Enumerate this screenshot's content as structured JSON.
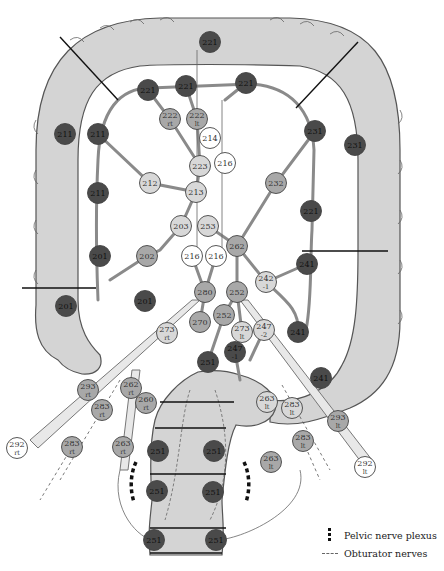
{
  "diagram": {
    "colors": {
      "colon_fill": "#d4d4d4",
      "colon_stroke": "#555555",
      "vessel": "#8a8a8a",
      "node_dark": "#4a4a4a",
      "node_mid": "#a8a8a8",
      "node_light": "#d8d8d8",
      "node_white": "#ffffff",
      "cut_line": "#111111"
    },
    "nodes": [
      {
        "id": "n221a",
        "label": "221",
        "sub": "",
        "x": 210,
        "y": 42,
        "shade": "dark"
      },
      {
        "id": "n221b",
        "label": "221",
        "sub": "",
        "x": 148,
        "y": 90,
        "shade": "dark"
      },
      {
        "id": "n221c",
        "label": "221",
        "sub": "",
        "x": 186,
        "y": 86,
        "shade": "dark"
      },
      {
        "id": "n221d",
        "label": "221",
        "sub": "",
        "x": 246,
        "y": 83,
        "shade": "dark"
      },
      {
        "id": "n222rt",
        "label": "222",
        "sub": "rt",
        "x": 170,
        "y": 119,
        "shade": "mid"
      },
      {
        "id": "n222lt",
        "label": "222",
        "sub": "lt",
        "x": 197,
        "y": 119,
        "shade": "mid"
      },
      {
        "id": "n214",
        "label": "214",
        "sub": "",
        "x": 210,
        "y": 138,
        "shade": "white"
      },
      {
        "id": "n216a",
        "label": "216",
        "sub": "",
        "x": 225,
        "y": 163,
        "shade": "white"
      },
      {
        "id": "n223",
        "label": "223",
        "sub": "",
        "x": 200,
        "y": 166,
        "shade": "light"
      },
      {
        "id": "n211a",
        "label": "211",
        "sub": "",
        "x": 65,
        "y": 134,
        "shade": "dark"
      },
      {
        "id": "n211b",
        "label": "211",
        "sub": "",
        "x": 98,
        "y": 134,
        "shade": "dark"
      },
      {
        "id": "n212",
        "label": "212",
        "sub": "",
        "x": 150,
        "y": 183,
        "shade": "light"
      },
      {
        "id": "n213",
        "label": "213",
        "sub": "",
        "x": 196,
        "y": 192,
        "shade": "light"
      },
      {
        "id": "n211c",
        "label": "211",
        "sub": "",
        "x": 98,
        "y": 193,
        "shade": "dark"
      },
      {
        "id": "n231a",
        "label": "231",
        "sub": "",
        "x": 315,
        "y": 131,
        "shade": "dark"
      },
      {
        "id": "n231b",
        "label": "231",
        "sub": "",
        "x": 355,
        "y": 145,
        "shade": "dark"
      },
      {
        "id": "n232",
        "label": "232",
        "sub": "",
        "x": 276,
        "y": 183,
        "shade": "mid"
      },
      {
        "id": "n221e",
        "label": "221",
        "sub": "",
        "x": 311,
        "y": 211,
        "shade": "dark"
      },
      {
        "id": "n203",
        "label": "203",
        "sub": "",
        "x": 181,
        "y": 226,
        "shade": "light"
      },
      {
        "id": "n253",
        "label": "253",
        "sub": "",
        "x": 208,
        "y": 226,
        "shade": "light"
      },
      {
        "id": "n262",
        "label": "262",
        "sub": "",
        "x": 237,
        "y": 246,
        "shade": "mid"
      },
      {
        "id": "n202",
        "label": "202",
        "sub": "",
        "x": 147,
        "y": 256,
        "shade": "mid"
      },
      {
        "id": "n201a",
        "label": "201",
        "sub": "",
        "x": 100,
        "y": 256,
        "shade": "dark"
      },
      {
        "id": "n216b",
        "label": "216",
        "sub": "",
        "x": 192,
        "y": 256,
        "shade": "white"
      },
      {
        "id": "n216c",
        "label": "216",
        "sub": "",
        "x": 216,
        "y": 256,
        "shade": "white"
      },
      {
        "id": "n241a",
        "label": "241",
        "sub": "",
        "x": 307,
        "y": 264,
        "shade": "dark"
      },
      {
        "id": "n242",
        "label": "242",
        "sub": "-1",
        "x": 266,
        "y": 282,
        "shade": "light"
      },
      {
        "id": "n201b",
        "label": "201",
        "sub": "",
        "x": 66,
        "y": 306,
        "shade": "dark"
      },
      {
        "id": "n201c",
        "label": "201",
        "sub": "",
        "x": 145,
        "y": 301,
        "shade": "dark"
      },
      {
        "id": "n280",
        "label": "280",
        "sub": "",
        "x": 205,
        "y": 292,
        "shade": "mid"
      },
      {
        "id": "n252a",
        "label": "252",
        "sub": "",
        "x": 237,
        "y": 292,
        "shade": "mid"
      },
      {
        "id": "n252b",
        "label": "252",
        "sub": "",
        "x": 224,
        "y": 315,
        "shade": "mid"
      },
      {
        "id": "n270",
        "label": "270",
        "sub": "",
        "x": 200,
        "y": 322,
        "shade": "mid"
      },
      {
        "id": "n273rt",
        "label": "273",
        "sub": "rt",
        "x": 167,
        "y": 333,
        "shade": "light"
      },
      {
        "id": "n273lt",
        "label": "273",
        "sub": "lt",
        "x": 242,
        "y": 332,
        "shade": "light"
      },
      {
        "id": "n247",
        "label": "247",
        "sub": "-2",
        "x": 264,
        "y": 330,
        "shade": "light"
      },
      {
        "id": "n241b",
        "label": "241",
        "sub": "",
        "x": 298,
        "y": 332,
        "shade": "dark"
      },
      {
        "id": "n247b",
        "label": "247",
        "sub": "-1",
        "x": 235,
        "y": 352,
        "shade": "dark"
      },
      {
        "id": "n251a",
        "label": "251",
        "sub": "",
        "x": 208,
        "y": 362,
        "shade": "dark"
      },
      {
        "id": "n241c",
        "label": "241",
        "sub": "",
        "x": 321,
        "y": 378,
        "shade": "dark"
      },
      {
        "id": "n293rt",
        "label": "293",
        "sub": "rt",
        "x": 88,
        "y": 390,
        "shade": "mid"
      },
      {
        "id": "n262rt",
        "label": "262",
        "sub": "rt",
        "x": 131,
        "y": 388,
        "shade": "mid"
      },
      {
        "id": "n260",
        "label": "260",
        "sub": "rt",
        "x": 146,
        "y": 403,
        "shade": "mid"
      },
      {
        "id": "n283rt1",
        "label": "283",
        "sub": "rt",
        "x": 102,
        "y": 410,
        "shade": "mid"
      },
      {
        "id": "n263lt",
        "label": "263",
        "sub": "lt",
        "x": 267,
        "y": 402,
        "shade": "light"
      },
      {
        "id": "n283lt1",
        "label": "283",
        "sub": "lt",
        "x": 292,
        "y": 408,
        "shade": "light"
      },
      {
        "id": "n293lt",
        "label": "293",
        "sub": "lt",
        "x": 338,
        "y": 421,
        "shade": "mid"
      },
      {
        "id": "n292rt",
        "label": "292",
        "sub": "rt",
        "x": 17,
        "y": 448,
        "shade": "white"
      },
      {
        "id": "n283rt2",
        "label": "283",
        "sub": "rt",
        "x": 72,
        "y": 447,
        "shade": "mid"
      },
      {
        "id": "n263rt",
        "label": "263",
        "sub": "rt",
        "x": 123,
        "y": 447,
        "shade": "mid"
      },
      {
        "id": "n251b",
        "label": "251",
        "sub": "",
        "x": 158,
        "y": 451,
        "shade": "dark"
      },
      {
        "id": "n251c",
        "label": "251",
        "sub": "",
        "x": 214,
        "y": 451,
        "shade": "dark"
      },
      {
        "id": "n283lt2",
        "label": "283",
        "sub": "lt",
        "x": 303,
        "y": 441,
        "shade": "mid"
      },
      {
        "id": "n263lt2",
        "label": "263",
        "sub": "lt",
        "x": 271,
        "y": 462,
        "shade": "mid"
      },
      {
        "id": "n292lt",
        "label": "292",
        "sub": "lt",
        "x": 365,
        "y": 467,
        "shade": "white"
      },
      {
        "id": "n251d",
        "label": "251",
        "sub": "",
        "x": 157,
        "y": 491,
        "shade": "dark"
      },
      {
        "id": "n251e",
        "label": "251",
        "sub": "",
        "x": 213,
        "y": 492,
        "shade": "dark"
      },
      {
        "id": "n251f",
        "label": "251",
        "sub": "",
        "x": 154,
        "y": 540,
        "shade": "dark"
      },
      {
        "id": "n251g",
        "label": "251",
        "sub": "",
        "x": 216,
        "y": 540,
        "shade": "dark"
      }
    ],
    "legend": [
      {
        "symbol": "thick-dashed-black",
        "label": "Pelvic nerve plexus"
      },
      {
        "symbol": "thin-dashed-gray",
        "label": "Obturator nerves"
      }
    ]
  }
}
